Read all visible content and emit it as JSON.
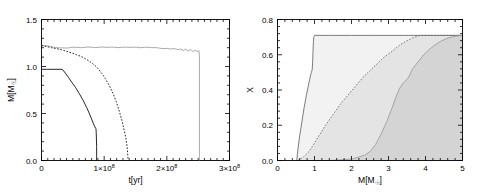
{
  "figure": {
    "background": "#ffffff",
    "panel_count": 2
  },
  "chart_data": [
    {
      "type": "line",
      "panel": "left",
      "title": "",
      "xlabel": "t[yr]",
      "ylabel": "M[M☉]",
      "xlim": [
        0,
        300000000
      ],
      "ylim": [
        0.0,
        1.5
      ],
      "xticks": [
        0,
        100000000,
        200000000,
        300000000
      ],
      "xticklabels": [
        "0",
        "1×10⁸",
        "2×10⁸",
        "3×10⁸"
      ],
      "yticks": [
        0.0,
        0.5,
        1.0,
        1.5
      ],
      "yticklabels": [
        "0.0",
        "0.5",
        "1.0",
        "1.5"
      ],
      "grid": false,
      "legend": "none",
      "series": [
        {
          "name": "total-mass-gray-solid",
          "style": "solid",
          "color": "#9a9a9a",
          "x": [
            0,
            5,
            10,
            14,
            18,
            22,
            26,
            30,
            35,
            40,
            45,
            50,
            56,
            62,
            68,
            74,
            80,
            86,
            92,
            98,
            104,
            110,
            116,
            122,
            128,
            134,
            140,
            146,
            152,
            158,
            164,
            170,
            176,
            182,
            188,
            194,
            200,
            206,
            212,
            218,
            222,
            226,
            230,
            234,
            238,
            242,
            246,
            249,
            251,
            252,
            252
          ],
          "y": [
            1.225,
            1.222,
            1.218,
            1.213,
            1.208,
            1.203,
            1.199,
            1.198,
            1.198,
            1.196,
            1.2,
            1.205,
            1.204,
            1.2,
            1.203,
            1.207,
            1.205,
            1.201,
            1.205,
            1.207,
            1.203,
            1.206,
            1.205,
            1.2,
            1.204,
            1.206,
            1.203,
            1.206,
            1.205,
            1.2,
            1.204,
            1.205,
            1.2,
            1.201,
            1.196,
            1.19,
            1.193,
            1.186,
            1.19,
            1.18,
            1.186,
            1.17,
            1.185,
            1.165,
            1.18,
            1.16,
            1.175,
            1.155,
            1.17,
            1.12,
            0.0
          ],
          "units": "x in 10^6 yr, y in Msun"
        },
        {
          "name": "mid-mass-black-dashed",
          "style": "dashed",
          "color": "#000000",
          "x": [
            0,
            8,
            16,
            24,
            32,
            40,
            48,
            56,
            64,
            72,
            80,
            88,
            96,
            102,
            108,
            114,
            119,
            123,
            126,
            129,
            131,
            133,
            134.5,
            136,
            137,
            137.5,
            138,
            138,
            138
          ],
          "y": [
            1.222,
            1.213,
            1.2,
            1.19,
            1.178,
            1.162,
            1.145,
            1.125,
            1.105,
            1.075,
            1.04,
            0.995,
            0.93,
            0.87,
            0.8,
            0.715,
            0.63,
            0.55,
            0.48,
            0.41,
            0.35,
            0.29,
            0.24,
            0.18,
            0.12,
            0.07,
            0.03,
            0.0,
            0.0
          ],
          "units": "x in 10^6 yr, y in Msun"
        },
        {
          "name": "low-mass-black-solid",
          "style": "solid",
          "color": "#000000",
          "x": [
            0,
            10,
            20,
            28,
            33,
            34,
            38,
            43,
            48,
            54,
            60,
            66,
            72,
            76,
            80,
            83,
            85,
            86,
            87,
            87.5,
            88,
            88,
            88
          ],
          "y": [
            0.97,
            0.97,
            0.97,
            0.97,
            0.97,
            0.965,
            0.93,
            0.885,
            0.835,
            0.78,
            0.715,
            0.645,
            0.565,
            0.505,
            0.44,
            0.39,
            0.36,
            0.345,
            0.34,
            0.26,
            0.15,
            0.05,
            0.0
          ],
          "units": "x in 10^6 yr, y in Msun"
        }
      ]
    },
    {
      "type": "area",
      "panel": "right",
      "title": "",
      "xlabel": "M[M☉]",
      "ylabel": "X",
      "xlim": [
        0,
        5
      ],
      "ylim": [
        0.0,
        0.8
      ],
      "xticks": [
        0,
        1,
        2,
        3,
        4,
        5
      ],
      "xticklabels": [
        "0",
        "1",
        "2",
        "3",
        "4",
        "5"
      ],
      "yticks": [
        0.0,
        0.2,
        0.4,
        0.6,
        0.8
      ],
      "yticklabels": [
        "0.0",
        "0.2",
        "0.4",
        "0.6",
        "0.8"
      ],
      "grid": false,
      "legend": "none",
      "series": [
        {
          "name": "hydrogen-profile-black-solid-lightest-fill",
          "style": "solid",
          "color": "#666666",
          "fill": "#f2f2f2",
          "x": [
            0.52,
            0.55,
            0.6,
            0.66,
            0.72,
            0.78,
            0.83,
            0.87,
            0.9,
            0.92,
            0.94,
            0.95,
            0.96,
            0.97,
            0.98,
            1.0,
            1.4,
            2.0,
            2.6,
            3.2,
            3.8,
            4.4,
            5.0
          ],
          "y": [
            0.0,
            0.06,
            0.14,
            0.22,
            0.3,
            0.37,
            0.42,
            0.46,
            0.49,
            0.5,
            0.52,
            0.56,
            0.62,
            0.67,
            0.7,
            0.71,
            0.71,
            0.71,
            0.71,
            0.71,
            0.71,
            0.71,
            0.71
          ]
        },
        {
          "name": "hydrogen-profile-black-dashed-mid-fill",
          "style": "dashed",
          "color": "#666666",
          "fill": "#e4e4e4",
          "x": [
            0.55,
            0.7,
            0.85,
            1.0,
            1.15,
            1.3,
            1.5,
            1.7,
            1.9,
            2.1,
            2.3,
            2.5,
            2.7,
            2.9,
            3.1,
            3.3,
            3.5,
            3.7,
            3.85,
            4.0,
            4.2,
            4.5,
            5.0
          ],
          "y": [
            0.0,
            0.02,
            0.05,
            0.1,
            0.15,
            0.2,
            0.26,
            0.32,
            0.37,
            0.42,
            0.47,
            0.51,
            0.55,
            0.59,
            0.62,
            0.655,
            0.68,
            0.7,
            0.71,
            0.71,
            0.71,
            0.71,
            0.71
          ]
        },
        {
          "name": "hydrogen-profile-gray-solid-darkest-fill",
          "style": "solid",
          "color": "#999999",
          "fill": "#d4d4d4",
          "x": [
            0.55,
            1.0,
            1.4,
            1.8,
            2.05,
            2.2,
            2.35,
            2.5,
            2.65,
            2.8,
            2.95,
            3.1,
            3.2,
            3.3,
            3.4,
            3.5,
            3.55,
            3.65,
            3.8,
            3.95,
            4.1,
            4.25,
            4.4,
            4.6,
            4.8,
            5.0
          ],
          "y": [
            0.0,
            0.0,
            0.0,
            0.005,
            0.01,
            0.02,
            0.03,
            0.05,
            0.09,
            0.15,
            0.22,
            0.3,
            0.36,
            0.41,
            0.44,
            0.46,
            0.475,
            0.52,
            0.56,
            0.6,
            0.63,
            0.655,
            0.675,
            0.695,
            0.705,
            0.71
          ]
        }
      ]
    }
  ]
}
